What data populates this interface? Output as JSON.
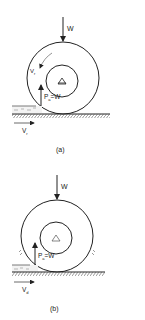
{
  "figures": [
    {
      "id": "a",
      "caption": "(a)",
      "load_label": "W",
      "reaction_label": "P",
      "reaction_subscript": "a",
      "reaction_eq": "=W",
      "rotation_label": "V",
      "rotation_subscript": "r",
      "speed_label": "V",
      "speed_subscript": "r"
    },
    {
      "id": "b",
      "caption": "(b)",
      "load_label": "W",
      "reaction_label": "P",
      "reaction_subscript": "a",
      "reaction_eq": "=W",
      "speed_label": "V",
      "speed_subscript": "d"
    }
  ],
  "colors": {
    "line": "#222222",
    "background": "#ffffff"
  }
}
